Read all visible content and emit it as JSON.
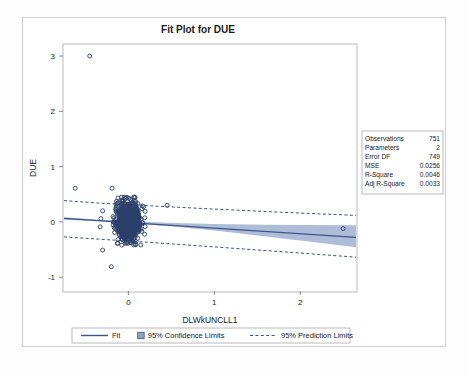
{
  "chart_data": {
    "type": "scatter",
    "title": "Fit Plot for DUE",
    "xlabel": "DLWkUNCLL1",
    "ylabel": "DUE",
    "xlim": [
      -0.75,
      2.65
    ],
    "ylim": [
      -1.25,
      3.2
    ],
    "xticks": [
      0,
      1,
      2
    ],
    "xtick_labels": [
      "0",
      "1",
      "2"
    ],
    "yticks": [
      -1,
      0,
      1,
      2,
      3
    ],
    "ytick_labels": [
      "-1",
      "0",
      "1",
      "2",
      "3"
    ],
    "grid": false,
    "legend_position": "bottom",
    "fit_line": {
      "name": "Fit",
      "intercept": -0.0115,
      "slope": -0.1012,
      "color": "#3c5488"
    },
    "confidence_band": {
      "name": "95% Confidence Limits",
      "level": 95,
      "color": "#8fa3c8",
      "x": [
        -0.75,
        -0.35,
        0.0,
        0.45,
        1.0,
        1.6,
        2.1,
        2.65
      ],
      "upper": [
        0.085,
        0.041,
        0.014,
        -0.014,
        -0.037,
        -0.051,
        -0.057,
        -0.059
      ],
      "lower": [
        0.041,
        0.012,
        -0.018,
        -0.074,
        -0.157,
        -0.262,
        -0.355,
        -0.459
      ]
    },
    "prediction_band": {
      "name": "95% Prediction Limits",
      "level": 95,
      "color": "#3c5488",
      "x": [
        -0.75,
        -0.35,
        0.0,
        0.45,
        1.0,
        1.6,
        2.1,
        2.65
      ],
      "upper": [
        0.385,
        0.341,
        0.311,
        0.275,
        0.232,
        0.188,
        0.153,
        0.118
      ],
      "lower": [
        -0.272,
        -0.312,
        -0.345,
        -0.392,
        -0.452,
        -0.518,
        -0.575,
        -0.638
      ]
    },
    "outliers": [
      {
        "x": -0.45,
        "y": 3.0
      },
      {
        "x": -0.62,
        "y": 0.61
      },
      {
        "x": -0.19,
        "y": 0.61
      },
      {
        "x": -0.3,
        "y": 0.2
      },
      {
        "x": -0.32,
        "y": 0.06
      },
      {
        "x": -0.33,
        "y": -0.09
      },
      {
        "x": -0.3,
        "y": -0.51
      },
      {
        "x": -0.2,
        "y": -0.81
      },
      {
        "x": 0.45,
        "y": 0.3
      },
      {
        "x": 2.5,
        "y": -0.12
      }
    ],
    "cluster": {
      "center_x": 0.0,
      "center_y": 0.0,
      "x_range": [
        -0.18,
        0.2
      ],
      "y_range": [
        -0.42,
        0.45
      ],
      "n_visible": 741
    },
    "n_points": 751
  },
  "stats_box": {
    "rows": [
      {
        "label": "Observations",
        "value": "751"
      },
      {
        "label": "Parameters",
        "value": "2"
      },
      {
        "label": "Error DF",
        "value": "749"
      },
      {
        "label": "MSE",
        "value": "0.0256"
      },
      {
        "label": "R-Square",
        "value": "0.0046"
      },
      {
        "label": "Adj R-Square",
        "value": "0.0033"
      }
    ]
  },
  "legend": {
    "items": [
      {
        "label": "Fit",
        "style": "solid-line"
      },
      {
        "label": "95% Confidence Limits",
        "style": "band-swatch"
      },
      {
        "label": "95% Prediction Limits",
        "style": "dashed-line"
      }
    ]
  },
  "colors": {
    "fit_line": "#3c5488",
    "band_fill": "#8fa3c8",
    "marker_stroke": "#2b3f6b",
    "frame": "#b9b9b9",
    "text": "#1a1a1a"
  }
}
